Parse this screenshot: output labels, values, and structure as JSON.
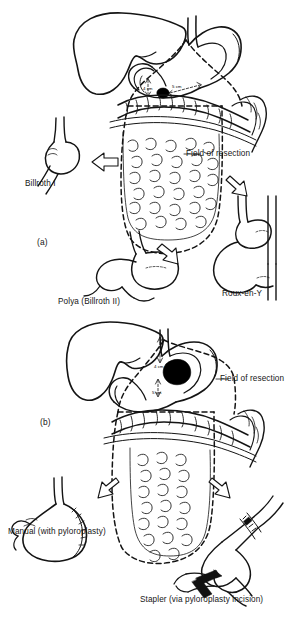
{
  "figure": {
    "type": "medical-illustration",
    "panels": [
      {
        "id": "a",
        "label": "(a)",
        "field_label": "Field of resection",
        "dimensions": [
          {
            "name": "proximal-margin",
            "value": "4 cm"
          },
          {
            "name": "distal-margin",
            "value": "5 cm"
          }
        ],
        "outcomes": [
          {
            "name": "billroth-1",
            "label": "Billroth I",
            "direction": "left"
          },
          {
            "name": "polya-billroth-2",
            "label": "Polya (Billroth II)",
            "direction": "down"
          },
          {
            "name": "roux-en-y",
            "label": "Roux-en-Y",
            "direction": "right"
          }
        ]
      },
      {
        "id": "b",
        "label": "(b)",
        "field_label": "Field of resection",
        "dimensions": [
          {
            "name": "proximal-margin",
            "value": "4 cm"
          },
          {
            "name": "distal-margin",
            "value": "5 cm"
          }
        ],
        "outcomes": [
          {
            "name": "manual-pyloroplasty",
            "label": "Manual (with pyloroplasty)",
            "direction": "left"
          },
          {
            "name": "stapler-pyloroplasty",
            "label": "Stapler (via pyloroplasty incision)",
            "direction": "right"
          }
        ]
      }
    ],
    "colors": {
      "ink": "#151515",
      "paper": "#ffffff",
      "tumor": "#000000"
    }
  }
}
